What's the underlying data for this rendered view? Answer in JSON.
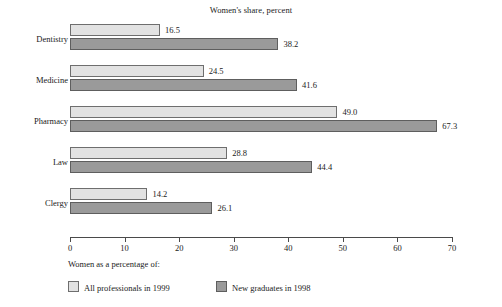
{
  "chart_data": {
    "type": "bar",
    "orientation": "horizontal",
    "title": "Women's share, percent",
    "xlabel": "",
    "ylabel": "",
    "xlim": [
      0,
      70
    ],
    "xticks": [
      0,
      10,
      20,
      30,
      40,
      50,
      60,
      70
    ],
    "xtick_labels": [
      "0",
      "10",
      "20",
      "30",
      "40",
      "50",
      "60",
      "70"
    ],
    "grid": false,
    "legend_position": "bottom-left",
    "legend_title": "Women as a percentage of:",
    "categories": [
      "Dentistry",
      "Medicine",
      "Pharmacy",
      "Law",
      "Clergy"
    ],
    "series": [
      {
        "name": "All professionals in 1999",
        "color": "#e2e2e2",
        "values": [
          16.5,
          24.5,
          49.0,
          28.8,
          14.2
        ],
        "value_labels": [
          "16.5",
          "24.5",
          "49.0",
          "28.8",
          "14.2"
        ]
      },
      {
        "name": "New graduates in 1998",
        "color": "#9a9a9a",
        "values": [
          38.2,
          41.6,
          67.3,
          44.4,
          26.1
        ],
        "value_labels": [
          "38.2",
          "41.6",
          "67.3",
          "44.4",
          "26.1"
        ]
      }
    ]
  },
  "colors": {
    "light_bar": "#e2e2e2",
    "dark_bar": "#9a9a9a",
    "bar_outline": "#6e6e6e",
    "axis": "#4a4a4a",
    "text": "#1a1a1a",
    "background": "#ffffff"
  }
}
